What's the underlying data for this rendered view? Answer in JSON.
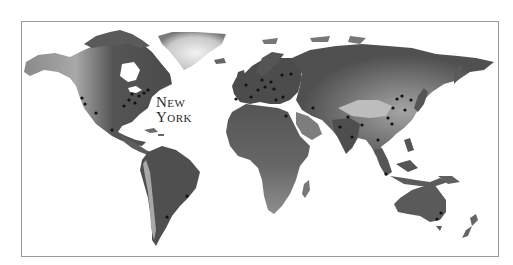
{
  "map": {
    "style": "grayscale shaded relief world map",
    "colors": {
      "background": "#ffffff",
      "frame": "#9a9a9a",
      "land_dark": "#4a4a4a",
      "land_mid": "#7a7a7a",
      "land_light": "#b5b5b5",
      "ice": "#dcdcdc",
      "city_dot": "#111111",
      "label": "#2a2a2a"
    },
    "highlight_label": {
      "line1": "New",
      "line2": "York"
    },
    "city_dots": [
      {
        "region": "north-america-west",
        "x": 82,
        "y": 98
      },
      {
        "region": "north-america-west",
        "x": 85,
        "y": 104
      },
      {
        "region": "north-america-west",
        "x": 96,
        "y": 113
      },
      {
        "region": "north-america-east",
        "x": 124,
        "y": 106
      },
      {
        "region": "north-america-east",
        "x": 129,
        "y": 100
      },
      {
        "region": "north-america-east",
        "x": 135,
        "y": 103
      },
      {
        "region": "north-america-east",
        "x": 139,
        "y": 96
      },
      {
        "region": "north-america-east",
        "x": 144,
        "y": 93
      },
      {
        "region": "north-america-east",
        "x": 148,
        "y": 90
      },
      {
        "region": "north-america-east",
        "x": 132,
        "y": 94
      },
      {
        "region": "mexico",
        "x": 112,
        "y": 130
      },
      {
        "region": "south-america",
        "x": 187,
        "y": 196
      },
      {
        "region": "south-america",
        "x": 167,
        "y": 217
      },
      {
        "region": "europe",
        "x": 246,
        "y": 85
      },
      {
        "region": "europe",
        "x": 251,
        "y": 97
      },
      {
        "region": "europe",
        "x": 258,
        "y": 90
      },
      {
        "region": "europe",
        "x": 262,
        "y": 80
      },
      {
        "region": "europe",
        "x": 265,
        "y": 87
      },
      {
        "region": "europe",
        "x": 271,
        "y": 82
      },
      {
        "region": "europe",
        "x": 274,
        "y": 89
      },
      {
        "region": "europe",
        "x": 282,
        "y": 75
      },
      {
        "region": "europe",
        "x": 291,
        "y": 74
      },
      {
        "region": "europe",
        "x": 276,
        "y": 100
      },
      {
        "region": "europe",
        "x": 283,
        "y": 97
      },
      {
        "region": "europe",
        "x": 236,
        "y": 99
      },
      {
        "region": "middle-east",
        "x": 286,
        "y": 116
      },
      {
        "region": "middle-east",
        "x": 313,
        "y": 108
      },
      {
        "region": "south-asia",
        "x": 340,
        "y": 127
      },
      {
        "region": "south-asia",
        "x": 348,
        "y": 117
      },
      {
        "region": "south-asia",
        "x": 352,
        "y": 137
      },
      {
        "region": "south-asia",
        "x": 362,
        "y": 125
      },
      {
        "region": "east-asia",
        "x": 388,
        "y": 118
      },
      {
        "region": "east-asia",
        "x": 393,
        "y": 108
      },
      {
        "region": "east-asia",
        "x": 397,
        "y": 99
      },
      {
        "region": "east-asia",
        "x": 402,
        "y": 96
      },
      {
        "region": "east-asia",
        "x": 405,
        "y": 110
      },
      {
        "region": "east-asia",
        "x": 411,
        "y": 100
      },
      {
        "region": "east-asia",
        "x": 392,
        "y": 124
      },
      {
        "region": "southeast-asia",
        "x": 378,
        "y": 140
      },
      {
        "region": "southeast-asia",
        "x": 386,
        "y": 174
      },
      {
        "region": "australia",
        "x": 437,
        "y": 219
      },
      {
        "region": "australia",
        "x": 441,
        "y": 213
      }
    ]
  }
}
